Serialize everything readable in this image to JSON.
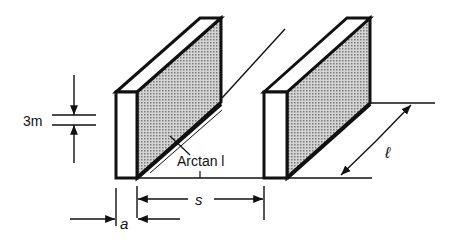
{
  "diagram": {
    "labels": {
      "gap_height": "3m",
      "angle": "Arctan l",
      "spacing": "s",
      "thickness": "a",
      "length": "ℓ"
    },
    "colors": {
      "stroke": "#111111",
      "shade": "#bdbdbd",
      "background": "#ffffff"
    }
  }
}
